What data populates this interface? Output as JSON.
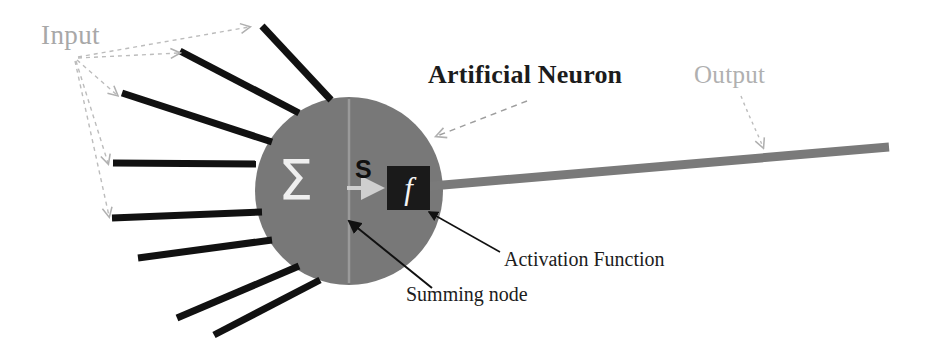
{
  "diagram": {
    "title": "Artificial Neuron",
    "canvas": {
      "width": 931,
      "height": 351,
      "background": "#ffffff"
    },
    "labels": {
      "input": "Input",
      "output": "Output",
      "neuron": "Artificial Neuron",
      "activation_function": "Activation Function",
      "summing_node": "Summing node",
      "sigma_symbol": "Σ",
      "sum_signal": "S",
      "activation_symbol": "f"
    },
    "colors": {
      "soma_fill": "#787878",
      "input_line": "#111111",
      "output_line": "#7a7a7a",
      "activation_box": "#1a1a1a",
      "activation_glyph": "#f4f4f4",
      "sigma_glyph": "#efefef",
      "callout_gray": "#b0b0b0",
      "callout_black": "#111111",
      "divider": "#9a9a9a",
      "inner_arrow": "#cfcfcf"
    },
    "soma": {
      "cx": 349,
      "cy": 191,
      "r": 94
    },
    "activation_box": {
      "x": 387,
      "y": 166,
      "w": 43,
      "h": 44
    },
    "input_dendrites": [
      {
        "id": "dendrite-1",
        "x1": 262,
        "y1": 26,
        "x2": 331,
        "y2": 100
      },
      {
        "id": "dendrite-2",
        "x1": 180,
        "y1": 51,
        "x2": 299,
        "y2": 113
      },
      {
        "id": "dendrite-3",
        "x1": 122,
        "y1": 93,
        "x2": 272,
        "y2": 142
      },
      {
        "id": "dendrite-4",
        "x1": 113,
        "y1": 163,
        "x2": 256,
        "y2": 164
      },
      {
        "id": "dendrite-5",
        "x1": 112,
        "y1": 218,
        "x2": 262,
        "y2": 212
      },
      {
        "id": "dendrite-6",
        "x1": 138,
        "y1": 258,
        "x2": 272,
        "y2": 240
      },
      {
        "id": "dendrite-7",
        "x1": 177,
        "y1": 318,
        "x2": 299,
        "y2": 266
      },
      {
        "id": "dendrite-8",
        "x1": 214,
        "y1": 335,
        "x2": 320,
        "y2": 280
      }
    ],
    "output_axon": {
      "x1": 426,
      "y1": 187,
      "x2": 889,
      "y2": 147
    },
    "input_callout_arrows": [
      {
        "id": "input-arrow-1",
        "to_x": 250,
        "to_y": 28
      },
      {
        "id": "input-arrow-2",
        "to_x": 180,
        "to_y": 53
      },
      {
        "id": "input-arrow-3",
        "to_x": 118,
        "to_y": 97
      },
      {
        "id": "input-arrow-4",
        "to_x": 109,
        "to_y": 164
      },
      {
        "id": "input-arrow-5",
        "to_x": 110,
        "to_y": 218
      }
    ],
    "input_callout_origin": {
      "x": 76,
      "y": 57
    },
    "neuron_callout": {
      "x1": 525,
      "y1": 100,
      "x2": 438,
      "y2": 135
    },
    "output_callout": {
      "x1": 739,
      "y1": 96,
      "x2": 764,
      "y2": 150
    },
    "activation_leader": {
      "x1": 500,
      "y1": 252,
      "x2": 428,
      "y2": 213
    },
    "summing_leader": {
      "x1": 430,
      "y1": 287,
      "x2": 352,
      "y2": 222
    },
    "divider_line": {
      "x1": 349,
      "y1": 100,
      "x2": 349,
      "y2": 282
    },
    "inner_arrow": {
      "x1": 349,
      "y1": 188,
      "x2": 385,
      "y2": 188
    }
  }
}
